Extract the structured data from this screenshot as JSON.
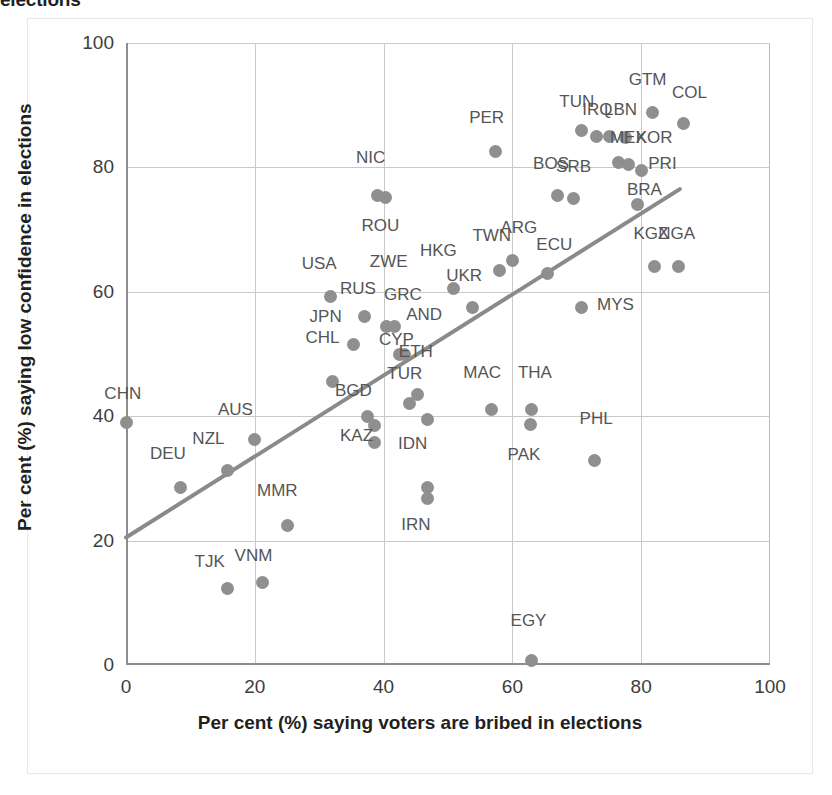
{
  "title": "elections",
  "axes": {
    "x_label": "Per cent (%) saying voters are bribed in elections",
    "y_label": "Per cent (%) saying low confidence in elections",
    "x_ticks": [
      "0",
      "20",
      "40",
      "60",
      "80",
      "100"
    ],
    "y_ticks": [
      "0",
      "20",
      "40",
      "60",
      "80",
      "100"
    ]
  },
  "chart_data": {
    "type": "scatter",
    "title": "elections",
    "xlabel": "Per cent (%) saying voters are bribed in elections",
    "ylabel": "Per cent (%) saying low confidence in elections",
    "xlim": [
      0,
      100
    ],
    "ylim": [
      0,
      100
    ],
    "xticks": [
      0,
      20,
      40,
      60,
      80,
      100
    ],
    "yticks": [
      0,
      20,
      40,
      60,
      80,
      100
    ],
    "grid": true,
    "legend": "none",
    "marker_color": "#8f8f8f",
    "trendline": {
      "color": "#8a8a8a",
      "x_start": 0,
      "y_start": 20.5,
      "x_end": 86,
      "y_end": 76.5
    },
    "points": [
      {
        "label": "CHN",
        "x": 0.0,
        "y": 39.0,
        "lx": -0.5,
        "ly": 43.5
      },
      {
        "label": "DEU",
        "x": 8.5,
        "y": 28.5,
        "lx": 6.5,
        "ly": 34.0
      },
      {
        "label": "NZL",
        "x": 15.8,
        "y": 31.2,
        "lx": 12.8,
        "ly": 36.3
      },
      {
        "label": "TJK",
        "x": 15.8,
        "y": 12.3,
        "lx": 13.0,
        "ly": 16.5
      },
      {
        "label": "AUS",
        "x": 20.0,
        "y": 36.3,
        "lx": 17.0,
        "ly": 41.0
      },
      {
        "label": "VNM",
        "x": 21.2,
        "y": 13.2,
        "lx": 19.8,
        "ly": 17.5
      },
      {
        "label": "MMR",
        "x": 25.0,
        "y": 22.5,
        "lx": 23.5,
        "ly": 28.0
      },
      {
        "label": "USA",
        "x": 31.8,
        "y": 59.2,
        "lx": 30.0,
        "ly": 64.5
      },
      {
        "label": "CHL",
        "x": 32.0,
        "y": 45.5,
        "lx": 30.5,
        "ly": 52.5
      },
      {
        "label": "JPN",
        "x": 35.3,
        "y": 51.5,
        "lx": 31.0,
        "ly": 56.0
      },
      {
        "label": "RUS",
        "x": 37.0,
        "y": 56.0,
        "lx": 36.0,
        "ly": 60.5
      },
      {
        "label": "BGD",
        "x": 37.5,
        "y": 40.0,
        "lx": 35.3,
        "ly": 44.0
      },
      {
        "label": "KAZ",
        "x": 38.6,
        "y": 38.5,
        "lx": 35.8,
        "ly": 36.8
      },
      {
        "label": "KOR-b",
        "x": 38.6,
        "y": 35.8,
        "lx": 35.8,
        "ly": 32.6
      },
      {
        "label": "NIC",
        "x": 39.0,
        "y": 75.5,
        "lx": 38.0,
        "ly": 81.5
      },
      {
        "label": "ROU",
        "x": 40.3,
        "y": 75.2,
        "lx": 39.5,
        "ly": 70.5
      },
      {
        "label": "ZWE",
        "x": 40.5,
        "y": 54.5,
        "lx": 40.8,
        "ly": 64.8
      },
      {
        "label": "GRC",
        "x": 41.7,
        "y": 54.5,
        "lx": 43.0,
        "ly": 59.5
      },
      {
        "label": "CYP",
        "x": 42.5,
        "y": 50.0,
        "lx": 42.0,
        "ly": 52.3
      },
      {
        "label": "AND",
        "x": 43.3,
        "y": 50.0,
        "lx": 46.3,
        "ly": 56.3
      },
      {
        "label": "TUR",
        "x": 44.0,
        "y": 42.0,
        "lx": 43.3,
        "ly": 46.8
      },
      {
        "label": "ETH",
        "x": 45.3,
        "y": 43.5,
        "lx": 45.0,
        "ly": 50.3
      },
      {
        "label": "IDN",
        "x": 46.8,
        "y": 28.5,
        "lx": 44.5,
        "ly": 35.5
      },
      {
        "label": "IRN",
        "x": 46.8,
        "y": 26.8,
        "lx": 45.0,
        "ly": 22.5
      },
      {
        "label": "IND",
        "x": 46.8,
        "y": 39.5,
        "lx": 46.8,
        "ly": 39.5
      },
      {
        "label": "HKG",
        "x": 50.8,
        "y": 60.5,
        "lx": 48.5,
        "ly": 66.5
      },
      {
        "label": "UKR",
        "x": 53.8,
        "y": 57.5,
        "lx": 52.5,
        "ly": 62.5
      },
      {
        "label": "MAC",
        "x": 56.8,
        "y": 41.0,
        "lx": 55.3,
        "ly": 47.0
      },
      {
        "label": "PER",
        "x": 57.3,
        "y": 82.5,
        "lx": 56.0,
        "ly": 88.0
      },
      {
        "label": "TWN",
        "x": 58.0,
        "y": 63.5,
        "lx": 56.8,
        "ly": 69.0
      },
      {
        "label": "ARG",
        "x": 60.0,
        "y": 65.0,
        "lx": 61.0,
        "ly": 70.3
      },
      {
        "label": "THA",
        "x": 63.0,
        "y": 41.0,
        "lx": 63.5,
        "ly": 47.0
      },
      {
        "label": "PAK",
        "x": 62.8,
        "y": 38.6,
        "lx": 61.8,
        "ly": 33.8
      },
      {
        "label": "EGY",
        "x": 63.0,
        "y": 0.8,
        "lx": 62.5,
        "ly": 7.0
      },
      {
        "label": "ECU",
        "x": 65.5,
        "y": 63.0,
        "lx": 66.5,
        "ly": 67.5
      },
      {
        "label": "BOS",
        "x": 67.0,
        "y": 75.5,
        "lx": 66.0,
        "ly": 80.5
      },
      {
        "label": "SRB",
        "x": 69.5,
        "y": 75.0,
        "lx": 69.5,
        "ly": 80.0
      },
      {
        "label": "MYS",
        "x": 70.8,
        "y": 57.5,
        "lx": 76.0,
        "ly": 57.8
      },
      {
        "label": "TUN",
        "x": 70.8,
        "y": 86.0,
        "lx": 70.0,
        "ly": 90.5
      },
      {
        "label": "IRQ",
        "x": 73.0,
        "y": 85.0,
        "lx": 73.2,
        "ly": 89.3
      },
      {
        "label": "PHL",
        "x": 72.8,
        "y": 32.8,
        "lx": 73.0,
        "ly": 39.5
      },
      {
        "label": "LBN",
        "x": 75.0,
        "y": 85.0,
        "lx": 76.8,
        "ly": 89.3
      },
      {
        "label": "ECU2",
        "x": 76.5,
        "y": 80.8,
        "lx": 76.5,
        "ly": 80.8
      },
      {
        "label": "MEX",
        "x": 77.5,
        "y": 84.8,
        "lx": 78.0,
        "ly": 84.8
      },
      {
        "label": "KOR",
        "x": 78.0,
        "y": 80.5,
        "lx": 82.0,
        "ly": 84.8
      },
      {
        "label": "GTM",
        "x": 81.8,
        "y": 88.8,
        "lx": 81.0,
        "ly": 94.0
      },
      {
        "label": "PRI",
        "x": 80.0,
        "y": 79.5,
        "lx": 83.3,
        "ly": 80.5
      },
      {
        "label": "BRA",
        "x": 79.5,
        "y": 74.0,
        "lx": 80.5,
        "ly": 76.3
      },
      {
        "label": "KGZ",
        "x": 82.0,
        "y": 64.0,
        "lx": 81.5,
        "ly": 69.3
      },
      {
        "label": "NGA",
        "x": 85.8,
        "y": 64.0,
        "lx": 85.5,
        "ly": 69.3
      },
      {
        "label": "COL",
        "x": 86.5,
        "y": 87.0,
        "lx": 87.5,
        "ly": 92.0
      }
    ]
  }
}
